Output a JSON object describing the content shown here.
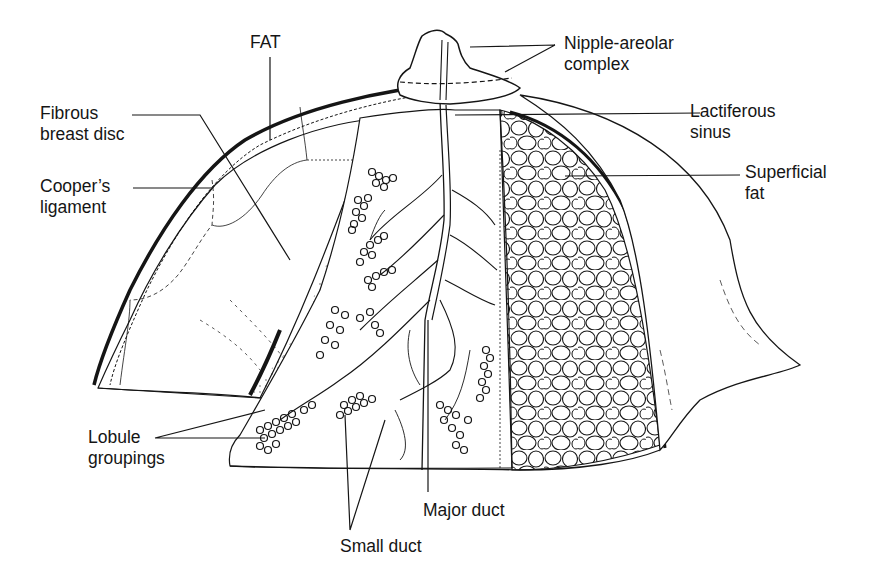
{
  "diagram": {
    "labels": {
      "fat": {
        "lines": [
          "FAT"
        ]
      },
      "fibrous_breast_disc": {
        "lines": [
          "Fibrous",
          "breast disc"
        ]
      },
      "coopers_ligament": {
        "lines": [
          "Cooper’s",
          "ligament"
        ]
      },
      "nipple_areolar_complex": {
        "lines": [
          "Nipple-areolar",
          "complex"
        ]
      },
      "lactiferous_sinus": {
        "lines": [
          "Lactiferous",
          "sinus"
        ]
      },
      "superficial_fat": {
        "lines": [
          "Superficial",
          "fat"
        ]
      },
      "lobule_groupings": {
        "lines": [
          "Lobule",
          "groupings"
        ]
      },
      "major_duct": {
        "lines": [
          "Major duct"
        ]
      },
      "small_duct": {
        "lines": [
          "Small duct"
        ]
      }
    },
    "colors": {
      "ink": "#151515",
      "background": "#ffffff"
    }
  }
}
